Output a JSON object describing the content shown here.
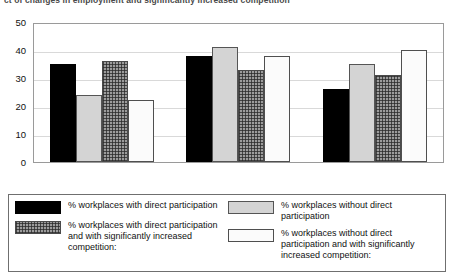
{
  "chart_data": {
    "type": "bar",
    "title": "ct of changes in employment and significantly increased competition",
    "xlabel": "",
    "ylabel": "",
    "ylim": [
      0,
      50
    ],
    "yticks": [
      0,
      10,
      20,
      30,
      40,
      50
    ],
    "grid": true,
    "legend_position": "bottom",
    "categories": [
      "increased",
      "remained the same",
      "decreased"
    ],
    "series": [
      {
        "name": "% workplaces with direct participation",
        "style": "solid-black",
        "color": "#000000",
        "values": [
          35,
          38,
          26
        ]
      },
      {
        "name": "% workplaces without direct participation",
        "style": "light-gray",
        "color": "#d4d4d4",
        "values": [
          24,
          41,
          35
        ]
      },
      {
        "name": "% workplaces with direct participation and with  significantly increased competition:",
        "style": "cross-hatch-gray",
        "color": "#9c9c9c",
        "values": [
          36,
          33,
          31
        ]
      },
      {
        "name": "% workplaces without direct participation and with  significantly increased competition:",
        "style": "white-outline",
        "color": "#fbfbfb",
        "values": [
          22,
          38,
          40
        ]
      }
    ]
  },
  "legend": {
    "entries": [
      {
        "label": "% workplaces with direct participation",
        "swatch": "solid-black"
      },
      {
        "label": "% workplaces with direct participation and with  significantly increased competition:",
        "swatch": "cross-hatch-gray"
      },
      {
        "label": "% workplaces without direct participation",
        "swatch": "light-gray"
      },
      {
        "label": "% workplaces without direct participation and with  significantly increased competition:",
        "swatch": "white-outline"
      }
    ]
  }
}
